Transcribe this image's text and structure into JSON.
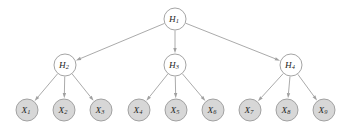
{
  "diagram": {
    "type": "directed-tree",
    "background_color": "#ffffff",
    "levels": 3,
    "edge_color": "#a0a0a0",
    "node_border_color": "#9a9a9a",
    "hidden_fill": "#ffffff",
    "observed_fill": "#d7d7d7",
    "nodes": [
      {
        "id": "H1",
        "base": "H",
        "sub": "1",
        "kind": "hidden",
        "cx": 175,
        "cy": 19,
        "r": 11
      },
      {
        "id": "H2",
        "base": "H",
        "sub": "2",
        "kind": "hidden",
        "cx": 65,
        "cy": 65,
        "r": 11
      },
      {
        "id": "H3",
        "base": "H",
        "sub": "3",
        "kind": "hidden",
        "cx": 175,
        "cy": 65,
        "r": 11
      },
      {
        "id": "H4",
        "base": "H",
        "sub": "4",
        "kind": "hidden",
        "cx": 291,
        "cy": 65,
        "r": 11
      },
      {
        "id": "X1",
        "base": "X",
        "sub": "1",
        "kind": "observed",
        "cx": 27,
        "cy": 110,
        "r": 11
      },
      {
        "id": "X2",
        "base": "X",
        "sub": "2",
        "kind": "observed",
        "cx": 64,
        "cy": 110,
        "r": 11
      },
      {
        "id": "X3",
        "base": "X",
        "sub": "3",
        "kind": "observed",
        "cx": 101,
        "cy": 110,
        "r": 11
      },
      {
        "id": "X4",
        "base": "X",
        "sub": "4",
        "kind": "observed",
        "cx": 139,
        "cy": 110,
        "r": 11
      },
      {
        "id": "X5",
        "base": "X",
        "sub": "5",
        "kind": "observed",
        "cx": 176,
        "cy": 110,
        "r": 11
      },
      {
        "id": "X6",
        "base": "X",
        "sub": "6",
        "kind": "observed",
        "cx": 213,
        "cy": 110,
        "r": 11
      },
      {
        "id": "X7",
        "base": "X",
        "sub": "7",
        "kind": "observed",
        "cx": 250,
        "cy": 110,
        "r": 11
      },
      {
        "id": "X8",
        "base": "X",
        "sub": "8",
        "kind": "observed",
        "cx": 287,
        "cy": 110,
        "r": 11
      },
      {
        "id": "X9",
        "base": "X",
        "sub": "9",
        "kind": "observed",
        "cx": 324,
        "cy": 110,
        "r": 11
      }
    ],
    "edges": [
      {
        "from": "H1",
        "to": "H2"
      },
      {
        "from": "H1",
        "to": "H3"
      },
      {
        "from": "H1",
        "to": "H4"
      },
      {
        "from": "H2",
        "to": "X1"
      },
      {
        "from": "H2",
        "to": "X2"
      },
      {
        "from": "H2",
        "to": "X3"
      },
      {
        "from": "H3",
        "to": "X4"
      },
      {
        "from": "H3",
        "to": "X5"
      },
      {
        "from": "H3",
        "to": "X6"
      },
      {
        "from": "H4",
        "to": "X7"
      },
      {
        "from": "H4",
        "to": "X8"
      },
      {
        "from": "H4",
        "to": "X9"
      }
    ]
  }
}
